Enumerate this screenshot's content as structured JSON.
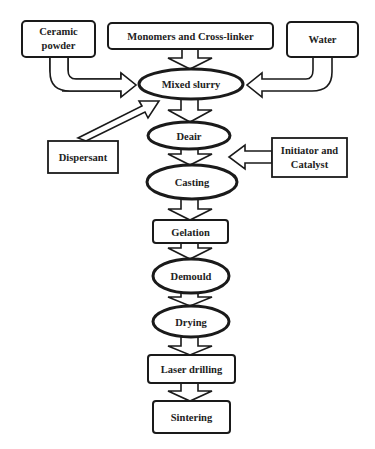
{
  "diagram": {
    "type": "flowchart",
    "colors": {
      "stroke": "#1a1a1a",
      "fill": "#ffffff",
      "text": "#222222"
    },
    "inputs": {
      "ceramic_powder": {
        "line1": "Ceramic",
        "line2": "powder"
      },
      "monomers": {
        "label": "Monomers and Cross-linker"
      },
      "water": {
        "label": "Water"
      },
      "dispersant": {
        "label": "Dispersant"
      },
      "initiator": {
        "line1": "Initiator and",
        "line2": "Catalyst"
      }
    },
    "steps": [
      {
        "id": "mixed_slurry",
        "label": "Mixed slurry",
        "shape": "ellipse"
      },
      {
        "id": "deair",
        "label": "Deair",
        "shape": "ellipse"
      },
      {
        "id": "casting",
        "label": "Casting",
        "shape": "ellipse"
      },
      {
        "id": "gelation",
        "label": "Gelation",
        "shape": "rect"
      },
      {
        "id": "demould",
        "label": "Demould",
        "shape": "ellipse"
      },
      {
        "id": "drying",
        "label": "Drying",
        "shape": "ellipse"
      },
      {
        "id": "laser_drilling",
        "label": "Laser drilling",
        "shape": "rect"
      },
      {
        "id": "sintering",
        "label": "Sintering",
        "shape": "rect"
      }
    ],
    "edges": [
      {
        "from": "Ceramic powder",
        "to": "Mixed slurry"
      },
      {
        "from": "Monomers and Cross-linker",
        "to": "Mixed slurry"
      },
      {
        "from": "Water",
        "to": "Mixed slurry"
      },
      {
        "from": "Dispersant",
        "to": "Mixed slurry"
      },
      {
        "from": "Mixed slurry",
        "to": "Deair"
      },
      {
        "from": "Initiator and Catalyst",
        "to": "Deair/Casting"
      },
      {
        "from": "Deair",
        "to": "Casting"
      },
      {
        "from": "Casting",
        "to": "Gelation"
      },
      {
        "from": "Gelation",
        "to": "Demould"
      },
      {
        "from": "Demould",
        "to": "Drying"
      },
      {
        "from": "Drying",
        "to": "Laser drilling"
      },
      {
        "from": "Laser drilling",
        "to": "Sintering"
      }
    ]
  }
}
